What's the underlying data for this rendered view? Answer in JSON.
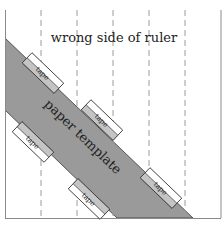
{
  "diagram": {
    "title": "wrong side of ruler",
    "band_label": "paper template",
    "tapes": [
      {
        "label": "tape"
      },
      {
        "label": "tape"
      },
      {
        "label": "tape"
      },
      {
        "label": "tape"
      },
      {
        "label": "tape"
      }
    ],
    "colors": {
      "band": "#999999",
      "band_edge": "#444444",
      "tape_fill": "#ffffff",
      "tape_overlap": "#c4c4c4",
      "frame": "#888888",
      "dashes": "#999999"
    }
  }
}
